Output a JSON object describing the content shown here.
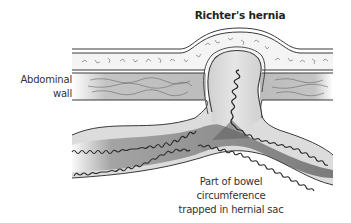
{
  "figure": {
    "title": "Richter's hernia",
    "labels": {
      "abdominal_wall_line1": "Abdominal",
      "abdominal_wall_line2": "wall",
      "bowel_line1": "Part of bowel",
      "bowel_line2": "circumference",
      "bowel_line3": "trapped in hernial sac"
    },
    "colors": {
      "outline": "#3a3a3a",
      "fat_layer": "#f2f2f2",
      "muscle_layer": "#c9c9c9",
      "bowel_light": "#d8d8d8",
      "bowel_dark": "#6e6e6e",
      "background": "#ffffff"
    }
  }
}
